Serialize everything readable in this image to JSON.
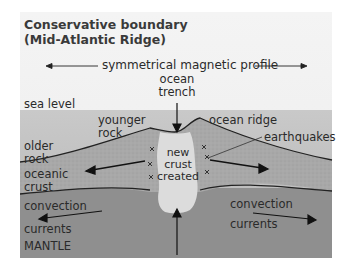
{
  "title": {
    "line1": "Conservative boundary",
    "line2": "(Mid-Atlantic Ridge)"
  },
  "labels": {
    "magnetic_profile": "symmetrical magnetic profile",
    "ocean_trench_1": "ocean",
    "ocean_trench_2": "trench",
    "sea_level": "sea level",
    "younger_rock_1": "younger",
    "younger_rock_2": "rock",
    "ocean_ridge": "ocean ridge",
    "older_rock_1": "older",
    "older_rock_2": "rock",
    "earthquakes": "earthquakes",
    "oceanic_crust_1": "oceanic",
    "oceanic_crust_2": "crust",
    "new_crust_1": "new",
    "new_crust_2": "crust",
    "new_crust_3": "created",
    "convection_left_1": "convection",
    "convection_left_2": "currents",
    "convection_right_1": "convection",
    "convection_right_2": "currents",
    "mantle": "MANTLE"
  },
  "colors": {
    "sea": "#bdbdbd",
    "crust": "#a9a9a9",
    "mantle": "#8f8f8f",
    "new_crust": "#d9d9d9",
    "line": "#222222"
  }
}
